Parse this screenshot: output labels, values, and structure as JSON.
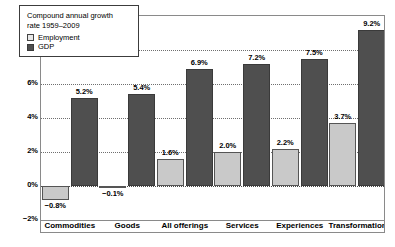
{
  "chart_data": {
    "type": "bar",
    "title": "",
    "subtitle": "",
    "xlabel": "",
    "ylabel": "",
    "ylim": [
      -2,
      10
    ],
    "ytick_labels": [
      "10%",
      "8%",
      "6%",
      "4%",
      "2%",
      "0%",
      "−2%"
    ],
    "ytick_values": [
      10,
      8,
      6,
      4,
      2,
      0,
      -2
    ],
    "grid": true,
    "legend_position": "top-left-inside",
    "categories": [
      "Commodities",
      "Goods",
      "All offerings",
      "Services",
      "Experiences",
      "Transformations"
    ],
    "series": [
      {
        "name": "Employment",
        "color": "#c9c9c9",
        "values": [
          -0.8,
          -0.1,
          1.6,
          2.0,
          2.2,
          3.7
        ],
        "labels": [
          "−0.8%",
          "−0.1%",
          "1.6%",
          "2.0%",
          "2.2%",
          "3.7%"
        ]
      },
      {
        "name": "GDP",
        "color": "#4f4f4f",
        "values": [
          5.2,
          5.4,
          6.9,
          7.2,
          7.5,
          9.2
        ],
        "labels": [
          "5.2%",
          "5.4%",
          "6.9%",
          "7.2%",
          "7.5%",
          "9.2%"
        ]
      }
    ]
  },
  "legend": {
    "title_line1": "Compound annual growth",
    "title_line2": "rate 1959–2009",
    "entries": [
      {
        "label": "Employment",
        "swatch": "employment-swatch"
      },
      {
        "label": "GDP",
        "swatch": "gdp-swatch"
      }
    ]
  }
}
